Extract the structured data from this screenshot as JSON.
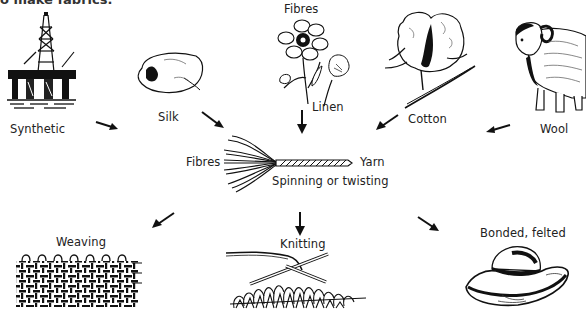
{
  "header": {
    "caption_fragment": "o make fabrics."
  },
  "sources": [
    {
      "id": "synthetic",
      "label": "Synthetic",
      "icon": "oil-rig-icon"
    },
    {
      "id": "silk",
      "label": "Silk",
      "icon": "silk-cocoon-icon"
    },
    {
      "id": "linen",
      "label": "Linen",
      "icon": "flax-flower-icon",
      "group_label": "Fibres"
    },
    {
      "id": "cotton",
      "label": "Cotton",
      "icon": "cotton-boll-icon"
    },
    {
      "id": "wool",
      "label": "Wool",
      "icon": "sheep-icon"
    }
  ],
  "process": {
    "input_label": "Fibres",
    "output_label": "Yarn",
    "step_label": "Spinning or twisting",
    "icon": "yarn-strand-icon"
  },
  "outputs": [
    {
      "id": "weaving",
      "label": "Weaving",
      "icon": "woven-fabric-icon"
    },
    {
      "id": "knitting",
      "label": "Knitting",
      "icon": "knitting-needles-icon"
    },
    {
      "id": "bonded",
      "label": "Bonded, felted",
      "icon": "felt-hat-icon"
    }
  ]
}
